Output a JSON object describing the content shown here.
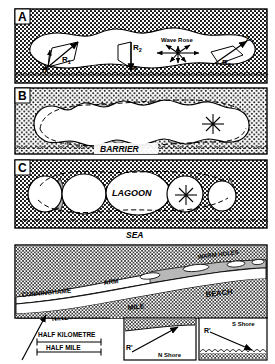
{
  "figure": {
    "panels": [
      {
        "id": "A",
        "label": "A",
        "labels": {
          "wave_rose": "Wave Rose",
          "r1": "R",
          "r1_sub": "1",
          "r2": "R",
          "r2_sub": "2",
          "r3": "R",
          "r3_sub": "3",
          "x": "X",
          "y": "Y",
          "z": "Z"
        }
      },
      {
        "id": "B",
        "label": "B",
        "labels": {
          "barrier": "BARRIER"
        }
      },
      {
        "id": "C",
        "label": "C",
        "labels": {
          "lagoon": "LAGOON",
          "sea": "SEA"
        }
      },
      {
        "id": "D",
        "label": "",
        "labels": {
          "cunninghame": "CUNNINGHAME",
          "arm": "ARM",
          "warm_holes": "WARM HOLES",
          "beach": "BEACH",
          "mile": "MILE",
          "ninety": "NINETY"
        }
      }
    ],
    "scale": {
      "metric": "HALF KILOMETRE",
      "imperial": "HALF MILE"
    },
    "insets": [
      {
        "id": "n-shore",
        "shore_label": "N Shore",
        "vector_label": "R'"
      },
      {
        "id": "s-shore",
        "shore_label": "S Shore",
        "vector_label": "R'"
      }
    ],
    "colors": {
      "ink": "#000000",
      "paper": "#ffffff",
      "shade": "#b8b8b8",
      "stipple": "#000000"
    }
  }
}
